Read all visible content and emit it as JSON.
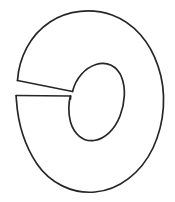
{
  "document": {
    "title": "Sliced ring line drawing",
    "kind": "black-and-white line art",
    "subject": "donut shape with a wedge slit cut from the left edge to the central hole"
  },
  "canvas": {
    "width": 175,
    "height": 202,
    "background_color": "#ffffff"
  },
  "style": {
    "stroke_color": "#262626",
    "stroke_width": 1.7,
    "fill": "none"
  },
  "shapes": [
    {
      "name": "outer-ring-outline",
      "description": "large tilted oval forming the outer boundary of the ring, open on the left where the slit exits",
      "path": "M 17.5 80.5 C 19 58 30 35 50 22 C 68 10 92 8 112 15 C 134 23 150 42 158 66 C 167 92 165 122 153 148 C 141 173 119 190 95 192 C 72 194 50 183 37 164 C 25 146 18 123 16.5 101 C 16.2 98 16.1 96 16.2 95.5"
    },
    {
      "name": "inner-hole-outline",
      "description": "tilted egg-shaped inner hole, open on its left side where the slit enters",
      "path": "M 72.5 91.5 C 76 78 85 68 96 64.5 C 107 61 117 66 121.5 77 C 126 88 125 103 120 116 C 115 129 105 139 94 140.5 C 83 142 74 134 70.5 122 C 68 113 68.5 102 70.5 96"
    },
    {
      "name": "slit-upper-edge",
      "description": "upper cut line of the wedge running from the outer left edge inward to the hole",
      "path": "M 17.5 80.5 L 72.5 91.5"
    },
    {
      "name": "slit-lower-edge",
      "description": "lower cut line of the wedge running from the outer left edge inward to the hole",
      "path": "M 16.2 95.5 L 70.5 96"
    },
    {
      "name": "slit-inner-notch",
      "description": "short vertical segment closing the wedge where it meets the inner hole",
      "path": "M 70.5 96 L 70.5 99"
    }
  ]
}
